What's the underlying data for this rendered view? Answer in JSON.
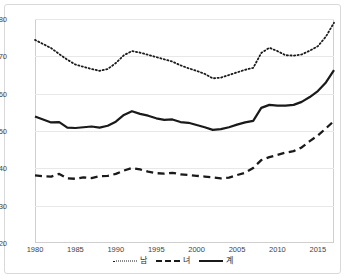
{
  "chart_data": {
    "type": "line",
    "title": "",
    "subtitle": "",
    "xlabel": "",
    "ylabel": "",
    "xlim": [
      1980,
      2017
    ],
    "ylim": [
      20,
      80
    ],
    "ytick_values": [
      20,
      30,
      40,
      50,
      60,
      70,
      80
    ],
    "ytick_labels": [
      "20",
      "30",
      "40",
      "50",
      "60",
      "70",
      "80"
    ],
    "xtick_values": [
      1980,
      1985,
      1990,
      1995,
      2000,
      2005,
      2010,
      2015
    ],
    "xtick_labels": [
      "1980",
      "1985",
      "1990",
      "1995",
      "2000",
      "2005",
      "2010",
      "2015"
    ],
    "grid": "horizontal",
    "legend_position": "bottom",
    "x": [
      1980,
      1981,
      1982,
      1983,
      1984,
      1985,
      1986,
      1987,
      1988,
      1989,
      1990,
      1991,
      1992,
      1993,
      1994,
      1995,
      1996,
      1997,
      1998,
      1999,
      2000,
      2001,
      2002,
      2003,
      2004,
      2005,
      2006,
      2007,
      2008,
      2009,
      2010,
      2011,
      2012,
      2013,
      2014,
      2015,
      2016,
      2017
    ],
    "series": [
      {
        "name": "남",
        "style": "dotted",
        "color": "#1a1a1a",
        "values": [
          74.4,
          73.3,
          72.2,
          70.6,
          69.1,
          67.8,
          67.2,
          66.6,
          66.1,
          66.6,
          68.2,
          70.3,
          71.4,
          71.0,
          70.4,
          69.8,
          69.2,
          68.6,
          67.6,
          66.8,
          66.1,
          65.3,
          64.1,
          64.3,
          65.0,
          65.7,
          66.4,
          66.9,
          70.9,
          72.3,
          71.4,
          70.3,
          70.2,
          70.5,
          71.5,
          72.7,
          75.3,
          79.0
        ]
      },
      {
        "name": "녀",
        "style": "dashed",
        "color": "#1a1a1a",
        "values": [
          38.1,
          37.9,
          37.8,
          38.5,
          37.3,
          37.2,
          37.6,
          37.4,
          37.9,
          38.0,
          38.5,
          39.4,
          40.1,
          39.7,
          39.1,
          38.7,
          38.6,
          38.8,
          38.4,
          38.2,
          38.0,
          37.8,
          37.6,
          37.3,
          37.5,
          38.2,
          38.8,
          40.1,
          42.2,
          43.0,
          43.6,
          44.2,
          44.6,
          45.6,
          47.3,
          48.8,
          50.7,
          52.7
        ]
      },
      {
        "name": "계",
        "style": "solid",
        "color": "#1a1a1a",
        "values": [
          53.9,
          53.1,
          52.3,
          52.4,
          50.9,
          50.8,
          51.0,
          51.2,
          50.9,
          51.4,
          52.5,
          54.3,
          55.3,
          54.6,
          54.1,
          53.4,
          53.0,
          53.1,
          52.4,
          52.2,
          51.6,
          51.0,
          50.3,
          50.5,
          51.0,
          51.7,
          52.3,
          52.7,
          56.2,
          57.0,
          56.8,
          56.8,
          57.0,
          57.8,
          59.1,
          60.7,
          63.0,
          66.3
        ]
      }
    ]
  },
  "legend": {
    "items": [
      {
        "label": "남"
      },
      {
        "label": "녀"
      },
      {
        "label": "계"
      }
    ]
  }
}
